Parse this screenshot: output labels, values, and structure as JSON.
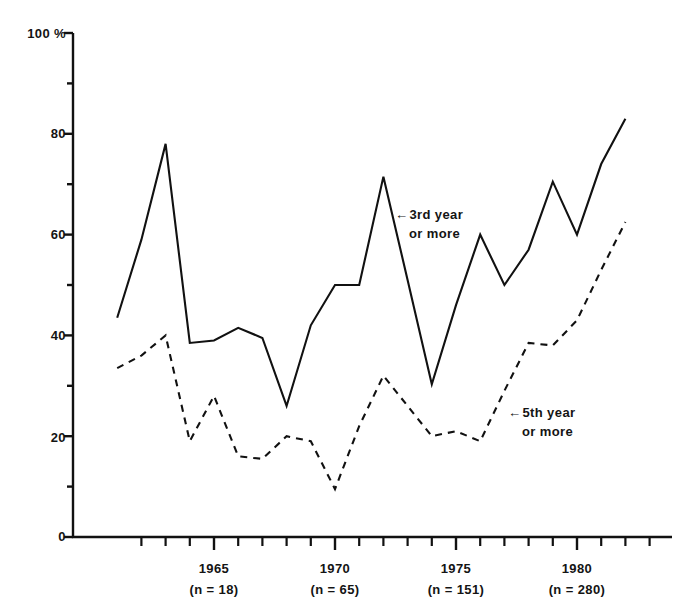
{
  "chart_data": {
    "type": "line",
    "title": "",
    "subtitle": "",
    "xlabel": "",
    "ylabel": "100 %",
    "xlim": [
      1961,
      1983
    ],
    "ylim": [
      0,
      100
    ],
    "grid": false,
    "legend_position": "inline-annotations",
    "y_ticks_major": [
      "0",
      "20",
      "40",
      "60",
      "80",
      "100 %"
    ],
    "y_tick_values": [
      0,
      20,
      40,
      60,
      80,
      100
    ],
    "y_minor_tick_values": [
      10,
      30,
      50,
      70,
      90
    ],
    "x_tick_labels": [
      "1965",
      "1970",
      "1975",
      "1980"
    ],
    "x_tick_values": [
      1965,
      1970,
      1975,
      1980
    ],
    "x_tick_sublabels": [
      "(n = 18)",
      "(n = 65)",
      "(n = 151)",
      "(n = 280)"
    ],
    "x_minor_tick_values": [
      1962,
      1963,
      1964,
      1966,
      1967,
      1968,
      1969,
      1971,
      1972,
      1973,
      1974,
      1976,
      1977,
      1978,
      1979,
      1981,
      1982,
      1983
    ],
    "x": [
      1961,
      1962,
      1963,
      1964,
      1965,
      1966,
      1967,
      1968,
      1969,
      1970,
      1971,
      1972,
      1973,
      1974,
      1975,
      1976,
      1977,
      1978,
      1979,
      1980,
      1981,
      1982
    ],
    "series": [
      {
        "name": "3rd year or more",
        "style": "solid",
        "color": "#111111",
        "values": [
          43.5,
          59,
          78,
          38.5,
          39,
          41.5,
          39.5,
          26,
          42,
          50,
          50,
          71.5,
          51,
          30.3,
          46,
          60,
          50,
          57,
          70.5,
          60,
          74,
          83
        ]
      },
      {
        "name": "5th year or more",
        "style": "dashed",
        "color": "#111111",
        "values": [
          33.5,
          36,
          40,
          19,
          28,
          16,
          15.5,
          20,
          19,
          9.5,
          22,
          32,
          26,
          20,
          21,
          19,
          29,
          38.5,
          38,
          43,
          53,
          62.5
        ]
      }
    ],
    "annotations": [
      {
        "name": "3rd-year-annotation",
        "arrow": "←",
        "line1": "3rd year",
        "line2": "or more",
        "target_x": 1972.5,
        "target_y": 62
      },
      {
        "name": "5th-year-annotation",
        "arrow": "←",
        "line1": "5th year",
        "line2": "or more",
        "target_x": 1977,
        "target_y": 26
      }
    ]
  }
}
